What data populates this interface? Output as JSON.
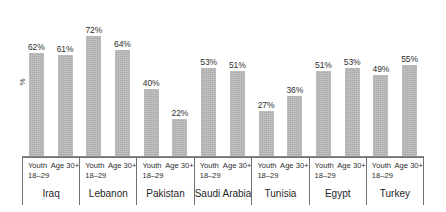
{
  "chart_data": {
    "type": "bar",
    "title": "",
    "subtitle": "",
    "xlabel": "",
    "ylabel": "%",
    "ylim": [
      0,
      80
    ],
    "grid": false,
    "legend": "none",
    "bar_color": "#b4b4b4",
    "categories": [
      "Iraq",
      "Lebanon",
      "Pakistan",
      "Saudi Arabia",
      "Tunisia",
      "Egypt",
      "Turkey"
    ],
    "subcategories": [
      "Youth 18–29",
      "Age 30+"
    ],
    "series": [
      {
        "name": "Youth 18–29",
        "values": [
          62,
          72,
          40,
          53,
          27,
          51,
          49
        ]
      },
      {
        "name": "Age 30+",
        "values": [
          61,
          64,
          22,
          51,
          36,
          53,
          55
        ]
      }
    ],
    "data_labels": [
      [
        "62%",
        "61%"
      ],
      [
        "72%",
        "64%"
      ],
      [
        "40%",
        "22%"
      ],
      [
        "53%",
        "51%"
      ],
      [
        "27%",
        "36%"
      ],
      [
        "51%",
        "53%"
      ],
      [
        "49%",
        "55%"
      ]
    ]
  },
  "axis": {
    "y_label": "%"
  },
  "groups": [
    {
      "country": "Iraq",
      "bars": [
        {
          "age_line1": "Youth",
          "age_line2": "18–29",
          "label": "62%",
          "value": 62
        },
        {
          "age_line1": "Age 30+",
          "age_line2": "",
          "label": "61%",
          "value": 61
        }
      ]
    },
    {
      "country": "Lebanon",
      "bars": [
        {
          "age_line1": "Youth",
          "age_line2": "18–29",
          "label": "72%",
          "value": 72
        },
        {
          "age_line1": "Age 30+",
          "age_line2": "",
          "label": "64%",
          "value": 64
        }
      ]
    },
    {
      "country": "Pakistan",
      "bars": [
        {
          "age_line1": "Youth",
          "age_line2": "18–29",
          "label": "40%",
          "value": 40
        },
        {
          "age_line1": "Age 30+",
          "age_line2": "",
          "label": "22%",
          "value": 22
        }
      ]
    },
    {
      "country": "Saudi Arabia",
      "bars": [
        {
          "age_line1": "Youth",
          "age_line2": "18–29",
          "label": "53%",
          "value": 53
        },
        {
          "age_line1": "Age 30+",
          "age_line2": "",
          "label": "51%",
          "value": 51
        }
      ]
    },
    {
      "country": "Tunisia",
      "bars": [
        {
          "age_line1": "Youth",
          "age_line2": "18–29",
          "label": "27%",
          "value": 27
        },
        {
          "age_line1": "Age 30+",
          "age_line2": "",
          "label": "36%",
          "value": 36
        }
      ]
    },
    {
      "country": "Egypt",
      "bars": [
        {
          "age_line1": "Youth",
          "age_line2": "18–29",
          "label": "51%",
          "value": 51
        },
        {
          "age_line1": "Age 30+",
          "age_line2": "",
          "label": "53%",
          "value": 53
        }
      ]
    },
    {
      "country": "Turkey",
      "bars": [
        {
          "age_line1": "Youth",
          "age_line2": "18–29",
          "label": "49%",
          "value": 49
        },
        {
          "age_line1": "Age 30+",
          "age_line2": "",
          "label": "55%",
          "value": 55
        }
      ]
    }
  ]
}
